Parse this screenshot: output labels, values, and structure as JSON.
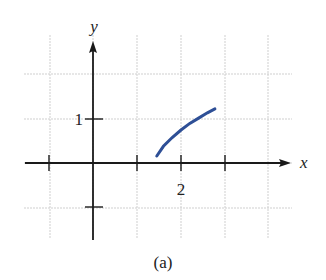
{
  "figure": {
    "caption": "(a)"
  },
  "chart_data": {
    "type": "line",
    "title": "",
    "caption": "(a)",
    "xlabel": "x",
    "ylabel": "y",
    "xlim": [
      -1,
      3
    ],
    "ylim": [
      -1,
      2
    ],
    "grid": true,
    "x_tick_positions": [
      -1,
      1,
      2,
      3
    ],
    "x_tick_labels": [
      {
        "value": 2,
        "label": "2"
      }
    ],
    "y_tick_positions": [
      1,
      -1
    ],
    "y_tick_labels": [
      {
        "value": 1,
        "label": "1"
      }
    ],
    "series": [
      {
        "name": "f(x)",
        "color": "#2e4f96",
        "x": [
          1.45,
          1.6,
          1.8,
          2.0,
          2.2,
          2.4,
          2.6,
          2.77
        ],
        "y": [
          0.16,
          0.38,
          0.58,
          0.75,
          0.9,
          1.02,
          1.14,
          1.23
        ]
      }
    ]
  },
  "layout": {
    "origin_px": [
      93,
      163
    ],
    "unit_px": 44,
    "grid_x_px": [
      50,
      93,
      137,
      181,
      225,
      268
    ],
    "grid_y_px": [
      74,
      119,
      163,
      208
    ]
  }
}
